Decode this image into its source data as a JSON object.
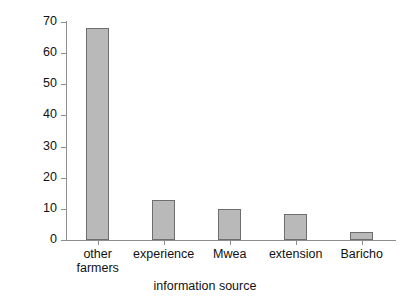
{
  "chart_data": {
    "type": "bar",
    "title": "",
    "subtitle": "",
    "xlabel": "information source",
    "ylabel": "percentage of farmers",
    "categories": [
      "other\nfarmers",
      "experience",
      "Mwea",
      "extension",
      "Baricho"
    ],
    "values": [
      68,
      13,
      10,
      8.5,
      2.5
    ],
    "ylim": [
      0,
      70
    ],
    "ytick_labels": [
      "0",
      "10",
      "20",
      "30",
      "40",
      "50",
      "60",
      "70"
    ],
    "ytick_values": [
      0,
      10,
      20,
      30,
      40,
      50,
      60,
      70
    ],
    "grid": false,
    "legend": null,
    "annotations": [],
    "colors": {
      "bar_fill": "#b9b9b9",
      "bar_border": "#6e6e6e",
      "axis": "#8d8d8d",
      "text": "#111111",
      "background": "#ffffff"
    }
  }
}
